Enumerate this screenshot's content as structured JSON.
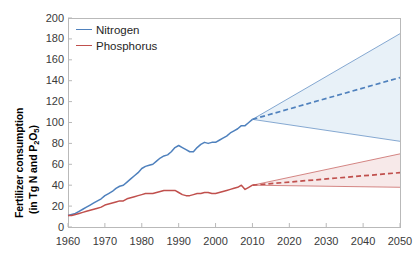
{
  "chart_data": {
    "type": "line",
    "title": "",
    "xlabel": "",
    "ylabel": "Fertilizer consumption (in Tg N and P2O5)",
    "ylabel_line1": "Fertilizer consumption",
    "ylabel_line2_pre": "(in Tg N and P",
    "ylabel_line2_sub": "2",
    "ylabel_line2_mid": "O",
    "ylabel_line2_sub2": "5",
    "ylabel_line2_post": ")",
    "xlim": [
      1960,
      2050
    ],
    "ylim": [
      0,
      200
    ],
    "yticks": [
      200,
      180,
      160,
      140,
      120,
      100,
      80,
      60,
      40,
      20,
      0
    ],
    "xticks": [
      1960,
      1970,
      1980,
      1990,
      2000,
      2010,
      2020,
      2030,
      2040,
      2050
    ],
    "grid": false,
    "legend_position": "top-left",
    "legend": [
      "Nitrogen",
      "Phosphorus"
    ],
    "colors": {
      "nitrogen": "#4f81bd",
      "phosphorus": "#c0504d",
      "nitrogen_fill": "#e8f1f8",
      "phosphorus_fill": "#f7e9e9",
      "axis": "#b9b9b9",
      "tick_text": "#3a3a3a"
    },
    "projection_start_year": 2010,
    "series": [
      {
        "name": "Nitrogen",
        "color": "#4f81bd",
        "historical": {
          "x": [
            1960,
            1961,
            1962,
            1963,
            1964,
            1965,
            1966,
            1967,
            1968,
            1969,
            1970,
            1971,
            1972,
            1973,
            1974,
            1975,
            1976,
            1977,
            1978,
            1979,
            1980,
            1981,
            1982,
            1983,
            1984,
            1985,
            1986,
            1987,
            1988,
            1989,
            1990,
            1991,
            1992,
            1993,
            1994,
            1995,
            1996,
            1997,
            1998,
            1999,
            2000,
            2001,
            2002,
            2003,
            2004,
            2005,
            2006,
            2007,
            2008,
            2009,
            2010
          ],
          "y": [
            11,
            12,
            13,
            15,
            17,
            19,
            21,
            23,
            25,
            27,
            30,
            32,
            34,
            37,
            39,
            40,
            43,
            46,
            49,
            52,
            56,
            58,
            59,
            60,
            63,
            66,
            68,
            69,
            72,
            76,
            78,
            76,
            74,
            72,
            72,
            76,
            79,
            81,
            80,
            81,
            81,
            83,
            85,
            87,
            90,
            92,
            94,
            97,
            97,
            100,
            103
          ]
        },
        "projection_upper": {
          "x": [
            2010,
            2050
          ],
          "y": [
            103,
            185
          ]
        },
        "projection_mid": {
          "x": [
            2010,
            2050
          ],
          "y": [
            103,
            143
          ]
        },
        "projection_lower": {
          "x": [
            2010,
            2050
          ],
          "y": [
            103,
            82
          ]
        }
      },
      {
        "name": "Phosphorus",
        "color": "#c0504d",
        "historical": {
          "x": [
            1960,
            1961,
            1962,
            1963,
            1964,
            1965,
            1966,
            1967,
            1968,
            1969,
            1970,
            1971,
            1972,
            1973,
            1974,
            1975,
            1976,
            1977,
            1978,
            1979,
            1980,
            1981,
            1982,
            1983,
            1984,
            1985,
            1986,
            1987,
            1988,
            1989,
            1990,
            1991,
            1992,
            1993,
            1994,
            1995,
            1996,
            1997,
            1998,
            1999,
            2000,
            2001,
            2002,
            2003,
            2004,
            2005,
            2006,
            2007,
            2008,
            2009,
            2010
          ],
          "y": [
            11,
            11,
            12,
            13,
            14,
            15,
            16,
            17,
            18,
            19,
            21,
            22,
            23,
            24,
            25,
            25,
            27,
            28,
            29,
            30,
            31,
            32,
            32,
            32,
            33,
            34,
            35,
            35,
            35,
            35,
            33,
            31,
            30,
            30,
            31,
            32,
            32,
            33,
            33,
            32,
            32,
            33,
            34,
            35,
            36,
            37,
            38,
            40,
            36,
            38,
            40
          ]
        },
        "projection_upper": {
          "x": [
            2010,
            2050
          ],
          "y": [
            40,
            70
          ]
        },
        "projection_mid": {
          "x": [
            2010,
            2050
          ],
          "y": [
            40,
            52
          ]
        },
        "projection_lower": {
          "x": [
            2010,
            2050
          ],
          "y": [
            40,
            38
          ]
        }
      }
    ]
  }
}
